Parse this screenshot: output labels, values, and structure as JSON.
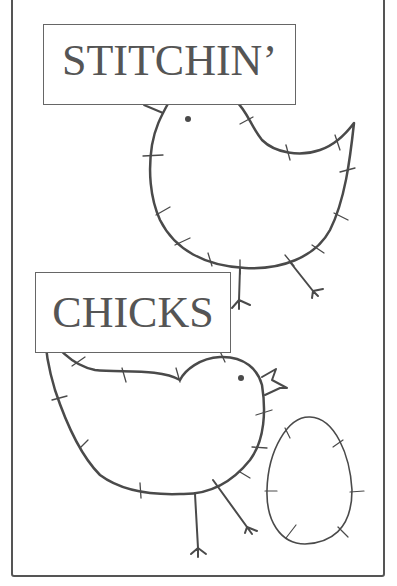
{
  "title": {
    "line1": "STITCHIN’",
    "line2": "CHICKS"
  },
  "illustration": {
    "elements": [
      "chick-top",
      "chick-bottom",
      "egg"
    ],
    "stroke_color": "#4a4a4a",
    "frame_color": "#555555",
    "background": "#ffffff"
  }
}
